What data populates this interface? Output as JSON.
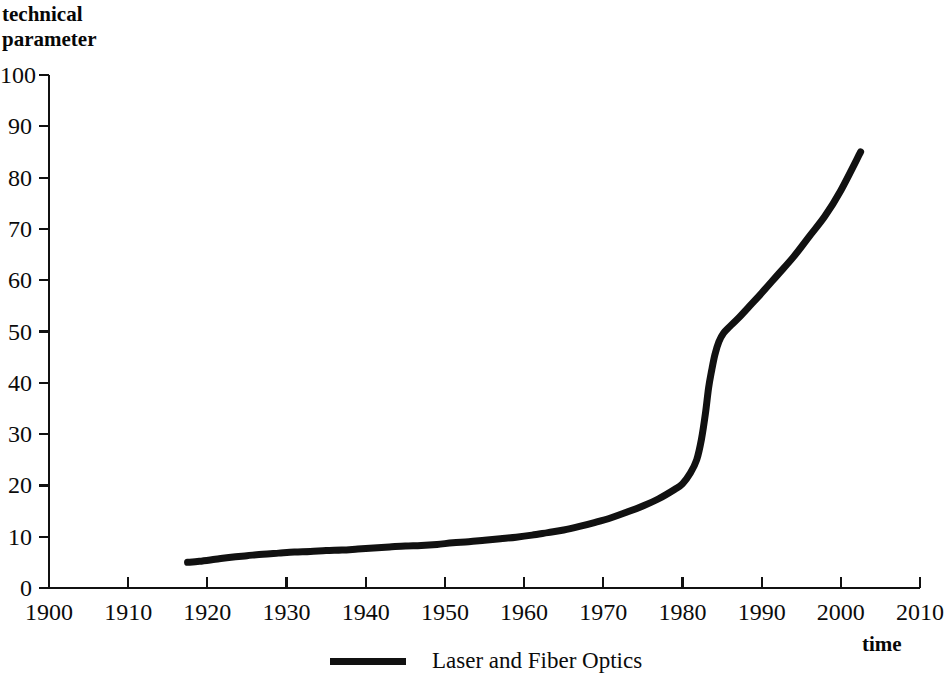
{
  "chart_data": {
    "type": "line",
    "title": "",
    "ylabel": "technical\nparameter",
    "xlabel": "time",
    "xlim": [
      1900,
      2010
    ],
    "ylim": [
      0,
      100
    ],
    "grid": false,
    "legend_position": "bottom-center",
    "x_ticks": [
      1900,
      1910,
      1920,
      1930,
      1940,
      1950,
      1960,
      1970,
      1980,
      1990,
      2000,
      2010
    ],
    "x_tick_labels": [
      "1900",
      "1910",
      "1920",
      "1930",
      "1940",
      "1950",
      "1960",
      "1970",
      "1980",
      "1990",
      "2000",
      "2010"
    ],
    "y_ticks": [
      0,
      10,
      20,
      30,
      40,
      50,
      60,
      70,
      80,
      90,
      100
    ],
    "y_tick_labels": [
      "0",
      "10",
      "20",
      "30",
      "40",
      "50",
      "60",
      "70",
      "80",
      "90",
      "100"
    ],
    "series": [
      {
        "name": "Laser and Fiber Optics",
        "color": "#111111",
        "line_width": 7,
        "x": [
          1917.5,
          1919,
          1921,
          1923,
          1925,
          1927,
          1929,
          1931,
          1933,
          1935,
          1937,
          1939,
          1941,
          1943,
          1945,
          1947,
          1949,
          1951,
          1953,
          1955,
          1957,
          1959,
          1961,
          1963,
          1965,
          1967,
          1969,
          1971,
          1973,
          1975,
          1977,
          1979,
          1980,
          1981,
          1981.8,
          1982.4,
          1982.9,
          1983.3,
          1983.7,
          1984.1,
          1984.6,
          1985.2,
          1986,
          1987,
          1988.5,
          1990,
          1992,
          1994,
          1996,
          1998,
          2000,
          2002.5
        ],
        "y": [
          5.0,
          5.2,
          5.6,
          6.0,
          6.3,
          6.6,
          6.8,
          7.0,
          7.1,
          7.3,
          7.4,
          7.6,
          7.8,
          8.0,
          8.2,
          8.3,
          8.5,
          8.8,
          9.0,
          9.3,
          9.6,
          9.9,
          10.3,
          10.8,
          11.3,
          12.0,
          12.8,
          13.7,
          14.8,
          16.0,
          17.4,
          19.2,
          20.3,
          22.4,
          25.0,
          29.0,
          34.0,
          39.0,
          42.5,
          45.5,
          48.0,
          49.7,
          51.0,
          52.5,
          55.0,
          57.5,
          61.0,
          64.5,
          68.5,
          72.5,
          77.5,
          85.0
        ]
      }
    ]
  },
  "legend": {
    "entries": [
      {
        "label": "Laser and Fiber Optics",
        "color": "#111111"
      }
    ]
  }
}
